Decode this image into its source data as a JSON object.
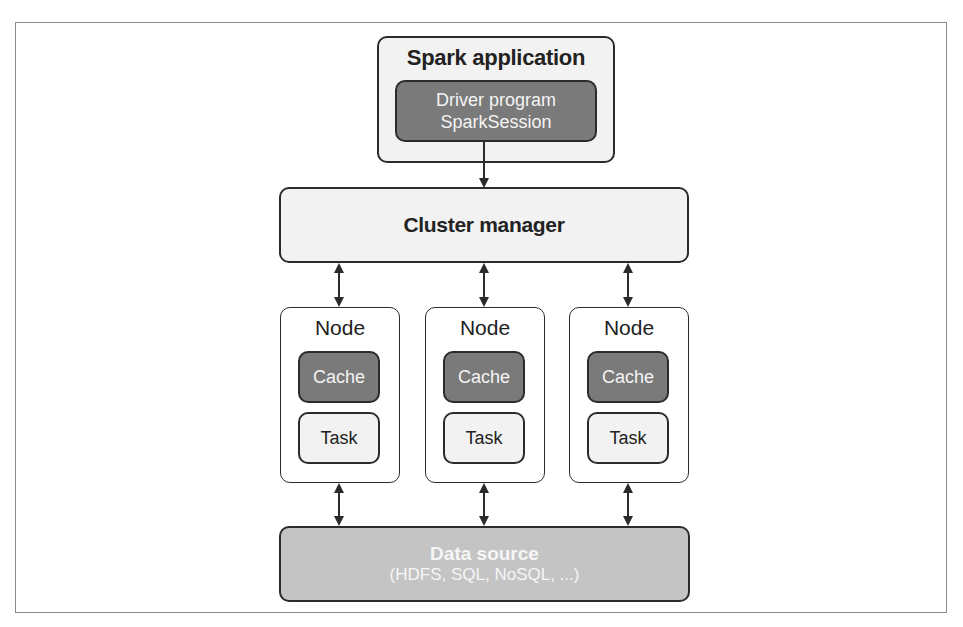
{
  "diagram": {
    "type": "architecture",
    "spark_application": {
      "title": "Spark application",
      "driver": {
        "line1": "Driver program",
        "line2": "SparkSession"
      }
    },
    "cluster_manager": {
      "label": "Cluster manager"
    },
    "nodes": [
      {
        "title": "Node",
        "cache": "Cache",
        "task": "Task"
      },
      {
        "title": "Node",
        "cache": "Cache",
        "task": "Task"
      },
      {
        "title": "Node",
        "cache": "Cache",
        "task": "Task"
      }
    ],
    "data_source": {
      "title": "Data source",
      "subtitle": "(HDFS, SQL, NoSQL, ...)"
    },
    "edges": [
      {
        "from": "driver",
        "to": "cluster_manager",
        "direction": "one-way"
      },
      {
        "from": "cluster_manager",
        "to": "node-1",
        "direction": "bidirectional"
      },
      {
        "from": "cluster_manager",
        "to": "node-2",
        "direction": "bidirectional"
      },
      {
        "from": "cluster_manager",
        "to": "node-3",
        "direction": "bidirectional"
      },
      {
        "from": "node-1",
        "to": "data_source",
        "direction": "bidirectional"
      },
      {
        "from": "node-2",
        "to": "data_source",
        "direction": "bidirectional"
      },
      {
        "from": "node-3",
        "to": "data_source",
        "direction": "bidirectional"
      }
    ],
    "colors": {
      "border": "#2b2b2b",
      "light_fill": "#f2f2f2",
      "dark_fill": "#7a7a7a",
      "datasource_fill": "#c4c4c4"
    }
  }
}
